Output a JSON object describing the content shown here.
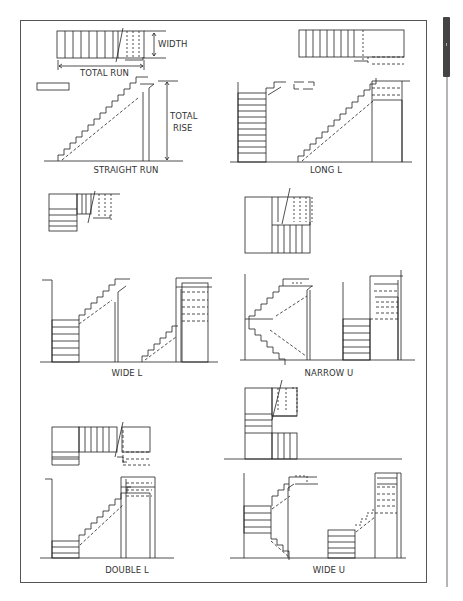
{
  "figure": {
    "dimension_labels": {
      "width": "WIDTH",
      "total_run": "TOTAL RUN",
      "total_rise_line1": "TOTAL",
      "total_rise_line2": "RISE"
    },
    "panels": [
      {
        "id": "straight-run",
        "caption": "STRAIGHT RUN"
      },
      {
        "id": "long-l",
        "caption": "LONG L"
      },
      {
        "id": "wide-l",
        "caption": "WIDE L"
      },
      {
        "id": "narrow-u",
        "caption": "NARROW U"
      },
      {
        "id": "double-l",
        "caption": "DOUBLE L"
      },
      {
        "id": "wide-u",
        "caption": "WIDE U"
      }
    ]
  },
  "scrollbar": {
    "orientation": "vertical",
    "thumb_position": "top"
  },
  "colors": {
    "line": "#222222",
    "frame": "#555555",
    "scroll_thumb": "#444444",
    "background": "#ffffff"
  }
}
